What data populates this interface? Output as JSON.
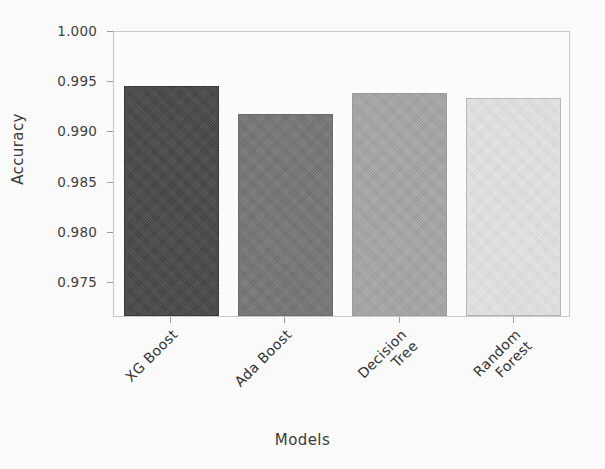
{
  "chart_data": {
    "type": "bar",
    "title": "",
    "xlabel": "Models",
    "ylabel": "Accuracy",
    "categories": [
      "XG Boost",
      "Ada Boost",
      "Decision Tree",
      "Random Forest"
    ],
    "values": [
      0.9945,
      0.9917,
      0.9938,
      0.9933
    ],
    "ylim": [
      0.9715,
      1.0
    ],
    "yticks": [
      "1.000",
      "0.995",
      "0.990",
      "0.985",
      "0.980",
      "0.975"
    ],
    "ytick_values": [
      1.0,
      0.995,
      0.99,
      0.985,
      0.98,
      0.975
    ],
    "grid": false,
    "legend": "none",
    "bar_colors": [
      "#454545",
      "#757575",
      "#a8a8a8",
      "#e9e9e9"
    ],
    "bar_edge_colors": [
      "#3a3a3a",
      "#6b6b6b",
      "#9c9c9c",
      "#b8b8b8"
    ],
    "bars": [
      {
        "label": "XG Boost",
        "label_line1": "XG Boost",
        "label_line2": "",
        "value": 0.9945,
        "color": "#454545",
        "edge": "#3a3a3a"
      },
      {
        "label": "Ada Boost",
        "label_line1": "Ada Boost",
        "label_line2": "",
        "value": 0.9917,
        "color": "#757575",
        "edge": "#6b6b6b"
      },
      {
        "label": "Decision Tree",
        "label_line1": "Decision",
        "label_line2": "Tree",
        "value": 0.9938,
        "color": "#a8a8a8",
        "edge": "#9c9c9c"
      },
      {
        "label": "Random Forest",
        "label_line1": "Random",
        "label_line2": "Forest",
        "value": 0.9933,
        "color": "#e9e9e9",
        "edge": "#b8b8b8"
      }
    ]
  },
  "axes": {
    "y_title": "Accuracy",
    "x_title": "Models"
  }
}
